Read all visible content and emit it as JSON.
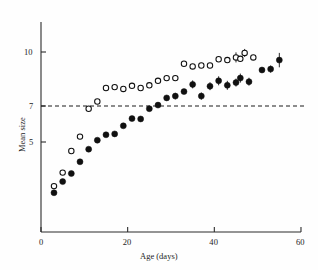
{
  "figure": {
    "background_color": "#fefefe",
    "ink_color": "#101010"
  },
  "axes": {
    "x_title": "Age (days)",
    "y_title": "Mean size",
    "x_ticks": [
      "0",
      "20",
      "40",
      "60"
    ],
    "y_ticks": [
      "10",
      "7",
      "5"
    ]
  },
  "reference_line": {
    "label": "7",
    "value": 7,
    "style": "dashed"
  },
  "chart_data": {
    "type": "scatter",
    "title": "",
    "xlabel": "Age (days)",
    "ylabel": "Mean size",
    "xlim": [
      0,
      60
    ],
    "ylim": [
      1.5,
      10.8
    ],
    "xticks": [
      0,
      20,
      40,
      60
    ],
    "yticks": [
      10,
      7,
      5
    ],
    "grid": false,
    "legend": "none",
    "annotations": [
      {
        "type": "hline",
        "y": 7,
        "style": "dashed",
        "label": "7"
      }
    ],
    "series": [
      {
        "name": "open-circles",
        "marker": "open circle",
        "marker_fill": "#ffffff",
        "marker_edge": "#101010",
        "points": [
          {
            "x": 3,
            "y": 2.55,
            "yerr": 0
          },
          {
            "x": 5,
            "y": 3.3,
            "yerr": 0
          },
          {
            "x": 7,
            "y": 4.5,
            "yerr": 0
          },
          {
            "x": 9,
            "y": 5.3,
            "yerr": 0
          },
          {
            "x": 11,
            "y": 6.85,
            "yerr": 0
          },
          {
            "x": 13,
            "y": 7.25,
            "yerr": 0
          },
          {
            "x": 15,
            "y": 8.0,
            "yerr": 0
          },
          {
            "x": 17,
            "y": 8.05,
            "yerr": 0
          },
          {
            "x": 19,
            "y": 7.95,
            "yerr": 0
          },
          {
            "x": 21,
            "y": 8.12,
            "yerr": 0
          },
          {
            "x": 23,
            "y": 8.0,
            "yerr": 0
          },
          {
            "x": 25,
            "y": 8.15,
            "yerr": 0
          },
          {
            "x": 27,
            "y": 8.4,
            "yerr": 0
          },
          {
            "x": 29,
            "y": 8.55,
            "yerr": 0
          },
          {
            "x": 31,
            "y": 8.55,
            "yerr": 0
          },
          {
            "x": 33,
            "y": 9.35,
            "yerr": 0
          },
          {
            "x": 35,
            "y": 9.2,
            "yerr": 0
          },
          {
            "x": 37,
            "y": 9.25,
            "yerr": 0
          },
          {
            "x": 39,
            "y": 9.25,
            "yerr": 0
          },
          {
            "x": 41,
            "y": 9.6,
            "yerr": 0
          },
          {
            "x": 43,
            "y": 9.55,
            "yerr": 0
          },
          {
            "x": 45,
            "y": 9.7,
            "yerr": 0.28
          },
          {
            "x": 46,
            "y": 9.62,
            "yerr": 0
          },
          {
            "x": 47,
            "y": 9.95,
            "yerr": 0.22
          },
          {
            "x": 49,
            "y": 9.7,
            "yerr": 0
          }
        ]
      },
      {
        "name": "filled-circles",
        "marker": "filled circle",
        "marker_fill": "#101010",
        "marker_edge": "#101010",
        "points": [
          {
            "x": 3,
            "y": 2.18,
            "yerr": 0
          },
          {
            "x": 5,
            "y": 2.8,
            "yerr": 0
          },
          {
            "x": 7,
            "y": 3.25,
            "yerr": 0
          },
          {
            "x": 9,
            "y": 3.9,
            "yerr": 0
          },
          {
            "x": 11,
            "y": 4.6,
            "yerr": 0
          },
          {
            "x": 13,
            "y": 5.1,
            "yerr": 0
          },
          {
            "x": 15,
            "y": 5.4,
            "yerr": 0
          },
          {
            "x": 17,
            "y": 5.45,
            "yerr": 0
          },
          {
            "x": 19,
            "y": 5.9,
            "yerr": 0
          },
          {
            "x": 21,
            "y": 6.3,
            "yerr": 0
          },
          {
            "x": 23,
            "y": 6.28,
            "yerr": 0
          },
          {
            "x": 25,
            "y": 6.85,
            "yerr": 0
          },
          {
            "x": 27,
            "y": 7.05,
            "yerr": 0
          },
          {
            "x": 29,
            "y": 7.45,
            "yerr": 0
          },
          {
            "x": 31,
            "y": 7.55,
            "yerr": 0.18
          },
          {
            "x": 33,
            "y": 7.8,
            "yerr": 0
          },
          {
            "x": 35,
            "y": 8.2,
            "yerr": 0.22
          },
          {
            "x": 37,
            "y": 7.55,
            "yerr": 0.2
          },
          {
            "x": 39,
            "y": 8.1,
            "yerr": 0.22
          },
          {
            "x": 41,
            "y": 8.4,
            "yerr": 0.25
          },
          {
            "x": 43,
            "y": 8.15,
            "yerr": 0.25
          },
          {
            "x": 45,
            "y": 8.3,
            "yerr": 0.22
          },
          {
            "x": 46,
            "y": 8.55,
            "yerr": 0.25
          },
          {
            "x": 48,
            "y": 8.35,
            "yerr": 0.22
          },
          {
            "x": 51,
            "y": 9.0,
            "yerr": 0
          },
          {
            "x": 53,
            "y": 9.05,
            "yerr": 0.2
          },
          {
            "x": 55,
            "y": 9.55,
            "yerr": 0.4
          }
        ]
      }
    ]
  }
}
